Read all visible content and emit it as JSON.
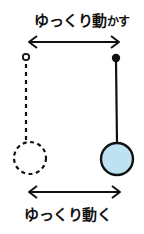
{
  "top_caption": {
    "main": "ゆっくり動",
    "suffix": "かす"
  },
  "bottom_caption": {
    "text": "ゆっくり動く"
  },
  "colors": {
    "ink": "#111111",
    "ball_fill": "#bfe2f2",
    "background": "#ffffff"
  },
  "pendulum_left": {
    "style": "dashed",
    "pivot": "hollow-dot",
    "bob": "dashed-circle"
  },
  "pendulum_right": {
    "style": "solid",
    "pivot": "filled-dot",
    "bob": "light-blue-circle"
  }
}
